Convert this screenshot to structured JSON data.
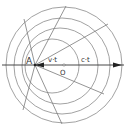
{
  "diagram": {
    "labels": {
      "point_a": "A",
      "point_o": "O",
      "source_displacement": "v·t",
      "wave_distance": "c·t"
    },
    "colors": {
      "line": "#8a8a8a",
      "arrow": "#222222",
      "text": "#333333"
    }
  }
}
